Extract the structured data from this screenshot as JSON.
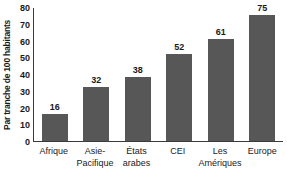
{
  "chart_data": {
    "type": "bar",
    "title": "",
    "xlabel": "",
    "ylabel": "Par tranche de 100 habitants",
    "ylim": [
      0,
      80
    ],
    "yticks": [
      0,
      10,
      20,
      30,
      40,
      50,
      60,
      70,
      80
    ],
    "grid": false,
    "legend": null,
    "bar_color": "#575757",
    "categories": [
      "Afrique",
      "Asie-Pacifique",
      "États arabes",
      "CEI",
      "Les Amériques",
      "Europe"
    ],
    "category_lines": [
      {
        "line1": "Afrique",
        "line2": ""
      },
      {
        "line1": "Asie-",
        "line2": "Pacifique"
      },
      {
        "line1": "États",
        "line2": "arabes"
      },
      {
        "line1": "CEI",
        "line2": ""
      },
      {
        "line1": "Les",
        "line2": "Amériques"
      },
      {
        "line1": "Europe",
        "line2": ""
      }
    ],
    "values": [
      16,
      32,
      38,
      52,
      61,
      75
    ],
    "value_labels": [
      "16",
      "32",
      "38",
      "52",
      "61",
      "75"
    ]
  }
}
